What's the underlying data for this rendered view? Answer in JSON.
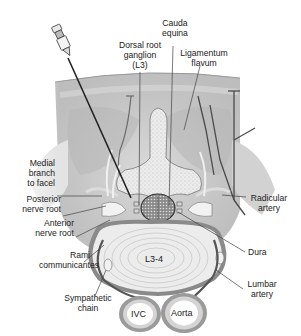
{
  "figure": {
    "colors": {
      "background": "#ffffff",
      "tissue_light": "#e6e6e6",
      "tissue_mid": "#c9c9c9",
      "tissue_dark": "#b3b3b3",
      "bone": "#eeeeee",
      "disc": "#e8e8e8",
      "vessel_wall": "#8c8c8c",
      "line": "#333333"
    }
  },
  "labels": {
    "cauda_equina": [
      "Cauda",
      "equina"
    ],
    "dorsal_root_ganglion": [
      "Dorsal root",
      "ganglion",
      "(L3)"
    ],
    "ligamentum_flavum": [
      "Ligamentum",
      "flavum"
    ],
    "medial_branch": [
      "Medial",
      "branch",
      "to facel"
    ],
    "posterior_nerve_root": [
      "Posterior",
      "nerve root"
    ],
    "anterior_nerve_root": [
      "Anterior",
      "nerve root"
    ],
    "rami_communicantes": [
      "Rami",
      "communicantes"
    ],
    "sympathetic_chain": [
      "Sympathetic",
      "chain"
    ],
    "radicular_artery": [
      "Radicular",
      "artery"
    ],
    "dura": [
      "Dura"
    ],
    "lumbar_artery": [
      "Lumbar",
      "artery"
    ]
  },
  "structures": {
    "disc_level": "L3-4",
    "ivc": "IVC",
    "aorta": "Aorta"
  }
}
